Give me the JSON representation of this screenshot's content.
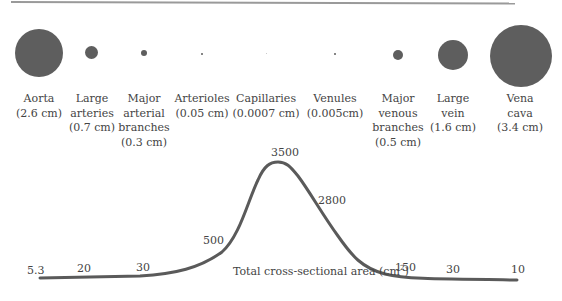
{
  "vessels": [
    {
      "name": "Aorta",
      "diameter": "(2.6 cm)",
      "lines": [
        "Aorta",
        "(2.6 cm)"
      ]
    },
    {
      "name": "Large arteries",
      "diameter": "(0.7 cm)",
      "lines": [
        "Large",
        "arteries",
        "(0.7 cm)"
      ]
    },
    {
      "name": "Major arterial branches",
      "diameter": "(0.3 cm)",
      "lines": [
        "Major",
        "arterial",
        "branches",
        "(0.3 cm)"
      ]
    },
    {
      "name": "Arterioles",
      "diameter": "(0.05 cm)",
      "lines": [
        "Arterioles",
        "(0.05 cm)"
      ]
    },
    {
      "name": "Capillaries",
      "diameter": "(0.0007 cm)",
      "lines": [
        "Capillaries",
        "(0.0007 cm)"
      ]
    },
    {
      "name": "Venules",
      "diameter": "(0.005cm)",
      "lines": [
        "Venules",
        "(0.005cm)"
      ]
    },
    {
      "name": "Major venous branches",
      "diameter": "(0.5 cm)",
      "lines": [
        "Major",
        "venous",
        "branches",
        "(0.5 cm)"
      ]
    },
    {
      "name": "Large vein",
      "diameter": "(1.6 cm)",
      "lines": [
        "Large",
        "vein",
        "(1.6 cm)"
      ]
    },
    {
      "name": "Vena cava",
      "diameter": "(3.4 cm)",
      "lines": [
        "Vena",
        "cava",
        "(3.4 cm)"
      ]
    }
  ],
  "curve": {
    "axis_label": "Total cross-sectional area (cm",
    "axis_label_sup": "2",
    "axis_label_close": ")",
    "values": [
      "5.3",
      "20",
      "30",
      "500",
      "3500",
      "2800",
      "150",
      "30",
      "10"
    ]
  },
  "colors": {
    "circle": "#5e5e5e",
    "curve": "#5a5a5a",
    "text": "#444444"
  }
}
